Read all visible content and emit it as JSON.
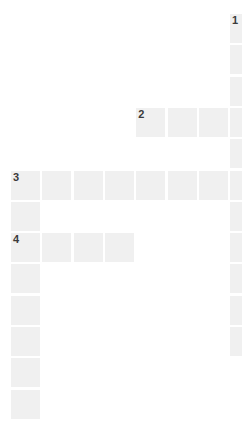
{
  "puzzle": {
    "title": "Crossword Grid",
    "grid": {
      "origin_x": 11,
      "origin_y": 14,
      "cell_size": 29,
      "pitch": 31.3,
      "columns": 8,
      "rows": 13,
      "cell_color": "#f0f0f0",
      "background_color": "#ffffff",
      "number_color": "#3b3b3b"
    },
    "numbers": [
      {
        "label": "1",
        "row": 0,
        "col": 7
      },
      {
        "label": "2",
        "row": 3,
        "col": 4
      },
      {
        "label": "3",
        "row": 5,
        "col": 0
      },
      {
        "label": "4",
        "row": 7,
        "col": 0
      }
    ],
    "cells": [
      {
        "row": 0,
        "col": 7,
        "number": "1",
        "letter": ""
      },
      {
        "row": 1,
        "col": 7,
        "number": "",
        "letter": ""
      },
      {
        "row": 2,
        "col": 7,
        "number": "",
        "letter": ""
      },
      {
        "row": 3,
        "col": 4,
        "number": "2",
        "letter": ""
      },
      {
        "row": 3,
        "col": 5,
        "number": "",
        "letter": ""
      },
      {
        "row": 3,
        "col": 6,
        "number": "",
        "letter": ""
      },
      {
        "row": 3,
        "col": 7,
        "number": "",
        "letter": ""
      },
      {
        "row": 4,
        "col": 7,
        "number": "",
        "letter": ""
      },
      {
        "row": 5,
        "col": 0,
        "number": "3",
        "letter": ""
      },
      {
        "row": 5,
        "col": 1,
        "number": "",
        "letter": ""
      },
      {
        "row": 5,
        "col": 2,
        "number": "",
        "letter": ""
      },
      {
        "row": 5,
        "col": 3,
        "number": "",
        "letter": ""
      },
      {
        "row": 5,
        "col": 4,
        "number": "",
        "letter": ""
      },
      {
        "row": 5,
        "col": 5,
        "number": "",
        "letter": ""
      },
      {
        "row": 5,
        "col": 6,
        "number": "",
        "letter": ""
      },
      {
        "row": 5,
        "col": 7,
        "number": "",
        "letter": ""
      },
      {
        "row": 6,
        "col": 0,
        "number": "",
        "letter": ""
      },
      {
        "row": 6,
        "col": 7,
        "number": "",
        "letter": ""
      },
      {
        "row": 7,
        "col": 0,
        "number": "4",
        "letter": ""
      },
      {
        "row": 7,
        "col": 1,
        "number": "",
        "letter": ""
      },
      {
        "row": 7,
        "col": 2,
        "number": "",
        "letter": ""
      },
      {
        "row": 7,
        "col": 3,
        "number": "",
        "letter": ""
      },
      {
        "row": 7,
        "col": 7,
        "number": "",
        "letter": ""
      },
      {
        "row": 8,
        "col": 0,
        "number": "",
        "letter": ""
      },
      {
        "row": 8,
        "col": 7,
        "number": "",
        "letter": ""
      },
      {
        "row": 9,
        "col": 0,
        "number": "",
        "letter": ""
      },
      {
        "row": 9,
        "col": 7,
        "number": "",
        "letter": ""
      },
      {
        "row": 10,
        "col": 0,
        "number": "",
        "letter": ""
      },
      {
        "row": 10,
        "col": 7,
        "number": "",
        "letter": ""
      },
      {
        "row": 11,
        "col": 0,
        "number": "",
        "letter": ""
      },
      {
        "row": 12,
        "col": 0,
        "number": "",
        "letter": ""
      }
    ],
    "entries": [
      {
        "number": "1",
        "direction": "down",
        "start_row": 0,
        "start_col": 7,
        "length": 11
      },
      {
        "number": "2",
        "direction": "across",
        "start_row": 3,
        "start_col": 4,
        "length": 4
      },
      {
        "number": "3",
        "direction": "across",
        "start_row": 5,
        "start_col": 0,
        "length": 8
      },
      {
        "number": "3",
        "direction": "down",
        "start_row": 5,
        "start_col": 0,
        "length": 8
      },
      {
        "number": "4",
        "direction": "across",
        "start_row": 7,
        "start_col": 0,
        "length": 4
      }
    ]
  }
}
